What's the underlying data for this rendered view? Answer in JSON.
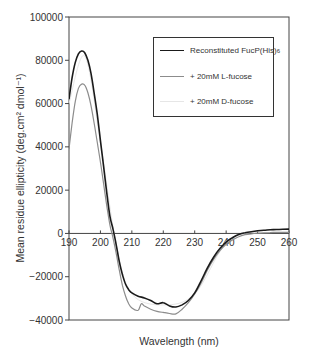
{
  "chart_data": {
    "type": "line",
    "title": "",
    "xlabel": "Wavelength (nm)",
    "ylabel": "Mean residue ellipticity (deg.cm² dmol⁻¹)",
    "xlim": [
      190,
      260
    ],
    "ylim": [
      -40000,
      100000
    ],
    "xticks": [
      190,
      200,
      210,
      220,
      230,
      240,
      250,
      260
    ],
    "yticks": [
      -40000,
      -20000,
      0,
      20000,
      40000,
      60000,
      80000,
      100000
    ],
    "grid": false,
    "legend_position": "upper right",
    "series": [
      {
        "name": "Reconstituted FucP(His)6",
        "color": "#1a1a1a",
        "width": 1.6,
        "x": [
          190,
          191,
          192,
          193,
          194,
          195,
          196,
          197,
          198,
          199,
          200,
          201,
          202,
          203,
          204,
          205,
          206,
          207,
          208,
          209,
          210,
          212,
          214,
          216,
          218,
          220,
          222,
          224,
          226,
          228,
          230,
          232,
          234,
          236,
          238,
          240,
          242,
          244,
          246,
          248,
          250,
          252,
          254,
          256,
          258,
          260
        ],
        "values": [
          62000,
          72000,
          79000,
          83000,
          84300,
          83500,
          80000,
          74000,
          65000,
          55000,
          43000,
          31000,
          19000,
          8000,
          2000,
          -5000,
          -13000,
          -19000,
          -23500,
          -26000,
          -27500,
          -29000,
          -29800,
          -31000,
          -32500,
          -32000,
          -33500,
          -34000,
          -33000,
          -31000,
          -27500,
          -22000,
          -16000,
          -11000,
          -7000,
          -4000,
          -2000,
          -500,
          300,
          800,
          1200,
          1500,
          1700,
          1800,
          1900,
          2000
        ]
      },
      {
        "name": "+ 20mM L-fucose",
        "color": "#8c8c8c",
        "width": 1.2,
        "x": [
          190,
          191,
          192,
          193,
          194,
          195,
          196,
          197,
          198,
          199,
          200,
          201,
          202,
          203,
          204,
          205,
          206,
          207,
          208,
          209,
          210,
          212,
          213,
          214,
          216,
          218,
          220,
          222,
          224,
          226,
          228,
          230,
          232,
          234,
          236,
          238,
          240,
          242,
          244,
          246,
          248,
          250,
          252,
          254,
          256,
          258,
          260
        ],
        "values": [
          39000,
          51000,
          61000,
          67000,
          69000,
          68500,
          65000,
          59000,
          51000,
          42000,
          33000,
          23000,
          13000,
          4000,
          -2000,
          -9000,
          -17000,
          -24000,
          -29000,
          -32500,
          -34500,
          -35500,
          -32500,
          -33500,
          -35000,
          -36000,
          -36500,
          -37000,
          -37200,
          -35000,
          -32000,
          -28000,
          -23000,
          -17000,
          -12000,
          -8000,
          -5000,
          -3000,
          -1500,
          -600,
          -200,
          100,
          300,
          400,
          500,
          500,
          500
        ]
      },
      {
        "name": "+ 20mM D-fucose",
        "color": "#e6e6e6",
        "width": 1.0,
        "x": [
          190,
          195,
          200,
          205,
          210,
          220,
          230,
          240,
          250,
          260
        ],
        "values": [
          60000,
          82000,
          42000,
          -5000,
          -28000,
          -33000,
          -28000,
          -4500,
          1000,
          1800
        ]
      }
    ]
  },
  "legend": {
    "items": [
      {
        "label_main": "Reconstituted FucP(His)",
        "label_sub": "6",
        "color": "#1a1a1a",
        "width": 1.6
      },
      {
        "label_main": "+ 20mM L-fucose",
        "label_sub": "",
        "color": "#8c8c8c",
        "width": 1.2
      },
      {
        "label_main": "+ 20mM D-fucose",
        "label_sub": "",
        "color": "#e6e6e6",
        "width": 1.0
      }
    ]
  }
}
